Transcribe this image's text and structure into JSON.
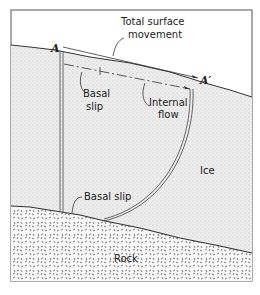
{
  "diagram": {
    "points": {
      "start_label": "A",
      "end_label": "A′"
    },
    "labels": {
      "total_surface_movement_line1": "Total surface",
      "total_surface_movement_line2": "movement",
      "basal_slip_top_line1": "Basal",
      "basal_slip_top_line2": "slip",
      "internal_flow_line1": "Internal",
      "internal_flow_line2": "flow",
      "ice": "Ice",
      "basal_slip_bottom": "Basal slip",
      "rock": "Rock"
    },
    "colors": {
      "line": "#333333",
      "ice_fill": "#ebebeb",
      "rock_fill": "#f4f4f4",
      "background": "#ffffff"
    }
  }
}
